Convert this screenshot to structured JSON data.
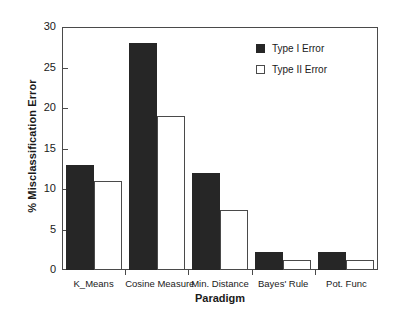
{
  "chart_data": {
    "type": "bar",
    "title": "",
    "xlabel": "Paradigm",
    "ylabel": "% Misclassification Error",
    "ylim": [
      0,
      30
    ],
    "yticks": [
      0,
      5,
      10,
      15,
      20,
      25,
      30
    ],
    "ytick_labels": [
      "0",
      "5",
      "10",
      "15",
      "20",
      "25",
      "30"
    ],
    "grid": false,
    "legend_position": "top-right",
    "categories": [
      "K_Means",
      "Cosine Measure",
      "Min. Distance",
      "Bayes' Rule",
      "Pot. Func"
    ],
    "series": [
      {
        "name": "Type I Error",
        "color": "#262626",
        "style": "filled",
        "values": [
          13,
          28,
          12,
          2.2,
          2.2
        ]
      },
      {
        "name": "Type II Error",
        "color": "#ffffff",
        "style": "open",
        "values": [
          11,
          19,
          7.4,
          1.2,
          1.2
        ]
      }
    ]
  },
  "legend": {
    "items": [
      {
        "label": "Type I Error",
        "swatch": "filled"
      },
      {
        "label": "Type II Error",
        "swatch": "open"
      }
    ]
  },
  "axes": {
    "y_title": "% Misclassification Error",
    "x_title": "Paradigm"
  },
  "colors": {
    "type1_fill": "#262626",
    "type2_fill": "#ffffff",
    "axis": "#4a4a4a",
    "text": "#1a1a1a",
    "background": "#ffffff"
  }
}
